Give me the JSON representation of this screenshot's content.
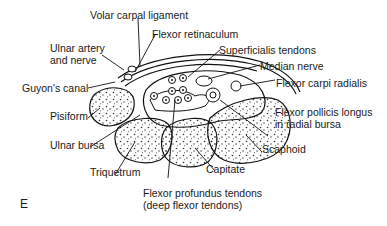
{
  "figure": {
    "panel_letter": "E",
    "labels": {
      "volar_carpal_ligament": "Volar carpal ligament",
      "flexor_retinaculum": "Flexor retinaculum",
      "ulnar_artery_nerve_1": "Ulnar artery",
      "ulnar_artery_nerve_2": "and nerve",
      "superficialis_tendons": "Superficialis tendons",
      "median_nerve": "Median nerve",
      "guyons_canal": "Guyon's canal",
      "flexor_carpi_radialis": "Flexor carpi radialis",
      "pisiform": "Pisiform",
      "flexor_pollicis_longus_1": "Flexor pollicis longus",
      "flexor_pollicis_longus_2": "in radial bursa",
      "ulnar_bursa": "Ulnar bursa",
      "scaphoid": "Scaphoid",
      "triquetrum": "Triquetrum",
      "capitate": "Capitate",
      "flexor_profundus_1": "Flexor profundus tendons",
      "flexor_profundus_2": "(deep flexor tendons)"
    }
  }
}
